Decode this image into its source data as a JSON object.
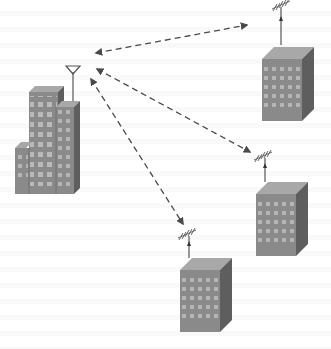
{
  "diagram": {
    "title": "",
    "colors": {
      "background": "#ffffff",
      "building_front": "#8a8a8a",
      "building_side": "#5e5e5e",
      "building_top": "#a8a8a8",
      "window": "#b9b9b9",
      "arrow": "#4a4a4a"
    },
    "nodes": [
      {
        "id": "central-tower",
        "label": "",
        "type": "building-cluster-with-antenna",
        "x": 15,
        "y": 65
      },
      {
        "id": "remote-building-1",
        "label": "",
        "type": "building-with-yagi-antenna",
        "x": 262,
        "y": 47
      },
      {
        "id": "remote-building-2",
        "label": "",
        "type": "building-with-yagi-antenna",
        "x": 256,
        "y": 182
      },
      {
        "id": "remote-building-3",
        "label": "",
        "type": "building-with-yagi-antenna",
        "x": 180,
        "y": 258
      }
    ],
    "links": [
      {
        "from": "central-tower",
        "to": "remote-building-1",
        "style": "dashed",
        "direction": "bidirectional"
      },
      {
        "from": "central-tower",
        "to": "remote-building-2",
        "style": "dashed",
        "direction": "bidirectional"
      },
      {
        "from": "central-tower",
        "to": "remote-building-3",
        "style": "dashed",
        "direction": "bidirectional"
      }
    ]
  }
}
